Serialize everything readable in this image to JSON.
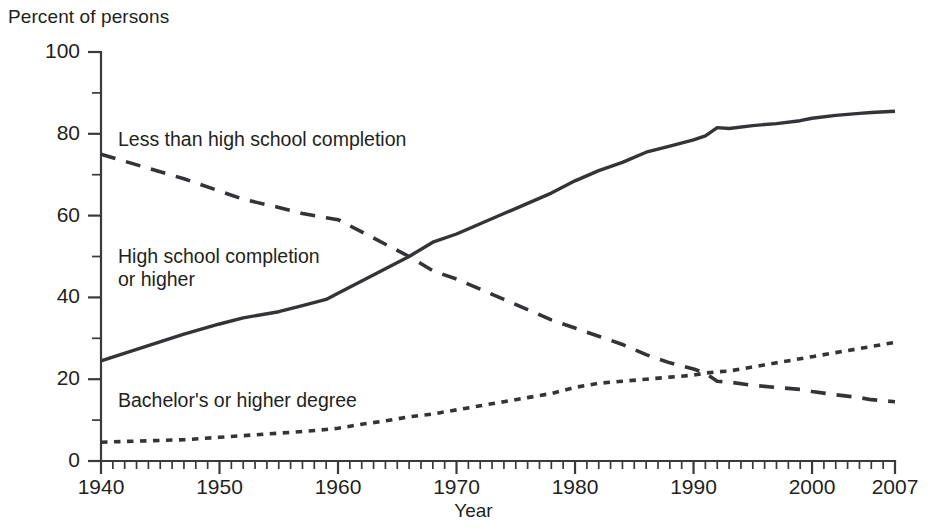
{
  "chart_data": {
    "type": "line",
    "title": "",
    "ylabel": "Percent of persons",
    "xlabel": "Year",
    "xlim": [
      1940,
      2007
    ],
    "ylim": [
      0,
      100
    ],
    "grid": false,
    "legend_position": "inline-annotations",
    "y_ticks_major": [
      0,
      20,
      40,
      60,
      80,
      100
    ],
    "y_ticks_minor": [
      10,
      30,
      50,
      70,
      90
    ],
    "x_ticks_major": [
      1940,
      1950,
      1960,
      1970,
      1980,
      1990,
      2000,
      2007
    ],
    "x_tick_minor_interval": 1,
    "x": [
      1940,
      1947,
      1950,
      1952,
      1955,
      1957,
      1959,
      1960,
      1962,
      1964,
      1966,
      1968,
      1970,
      1972,
      1974,
      1976,
      1978,
      1980,
      1982,
      1984,
      1986,
      1988,
      1990,
      1991,
      1992,
      1993,
      1995,
      1997,
      1999,
      2000,
      2002,
      2004,
      2005,
      2007
    ],
    "series": [
      {
        "name": "Less than high school completion",
        "style": "dashed",
        "values": [
          75.0,
          69.0,
          66.0,
          64.0,
          62.0,
          60.5,
          59.5,
          59.0,
          56.0,
          53.0,
          50.0,
          46.5,
          44.5,
          42.0,
          39.5,
          37.0,
          34.5,
          32.5,
          30.5,
          28.5,
          26.0,
          24.0,
          22.5,
          21.5,
          19.5,
          19.3,
          18.5,
          18.0,
          17.5,
          17.0,
          16.2,
          15.5,
          15.0,
          14.5
        ]
      },
      {
        "name": "High school completion or higher",
        "style": "solid",
        "values": [
          24.5,
          31.0,
          33.5,
          35.0,
          36.5,
          38.0,
          39.5,
          41.0,
          44.0,
          47.0,
          50.0,
          53.5,
          55.5,
          58.0,
          60.5,
          63.0,
          65.5,
          68.5,
          71.0,
          73.0,
          75.5,
          77.0,
          78.5,
          79.5,
          81.5,
          81.3,
          82.0,
          82.5,
          83.2,
          83.8,
          84.5,
          85.0,
          85.2,
          85.5
        ]
      },
      {
        "name": "Bachelor's or higher degree",
        "style": "dotted",
        "values": [
          4.6,
          5.2,
          5.8,
          6.2,
          6.8,
          7.2,
          7.7,
          8.0,
          9.0,
          9.8,
          10.8,
          11.5,
          12.5,
          13.5,
          14.5,
          15.5,
          16.5,
          18.0,
          19.0,
          19.5,
          20.0,
          20.5,
          21.0,
          21.5,
          21.8,
          22.0,
          23.0,
          24.0,
          25.0,
          25.5,
          26.5,
          27.5,
          28.0,
          29.0
        ]
      }
    ],
    "annotations": [
      {
        "text": "Less than high school completion",
        "x_px": 118,
        "y_px": 128
      },
      {
        "text": "High school completion\nor higher",
        "x_px": 118,
        "y_px": 245
      },
      {
        "text": "Bachelor's or higher degree",
        "x_px": 118,
        "y_px": 389
      }
    ]
  }
}
